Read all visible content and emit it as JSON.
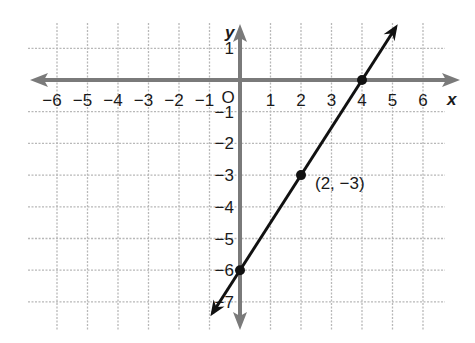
{
  "chart_data": {
    "type": "line",
    "title": "",
    "xlabel": "x",
    "ylabel": "y",
    "origin_label": "O",
    "xlim": [
      -6.5,
      6.5
    ],
    "ylim": [
      -7.5,
      1.9
    ],
    "grid": true,
    "x_ticks": [
      -6,
      -5,
      -4,
      -3,
      -2,
      -1,
      1,
      2,
      3,
      4,
      5,
      6
    ],
    "x_tick_labels": [
      "−6",
      "−5",
      "−4",
      "−3",
      "−2",
      "−1",
      "1",
      "2",
      "3",
      "4",
      "5",
      "6"
    ],
    "y_ticks": [
      1,
      -1,
      -2,
      -3,
      -4,
      -5,
      -6,
      -7
    ],
    "y_tick_labels": [
      "1",
      "−1",
      "−2",
      "−3",
      "−4",
      "−5",
      "−6",
      "−7"
    ],
    "series": [
      {
        "name": "line",
        "equation": "y = 1.5x - 6",
        "x": [
          -0.9,
          5.1
        ],
        "y": [
          -7.35,
          1.65
        ],
        "color": "#111111"
      }
    ],
    "points": [
      {
        "x": 0,
        "y": -6
      },
      {
        "x": 2,
        "y": -3
      },
      {
        "x": 4,
        "y": 0
      }
    ],
    "annotations": [
      {
        "text": "(2, −3)",
        "x": 2,
        "y": -3
      }
    ],
    "colors": {
      "axis": "#7a7a7a",
      "grid": "#b8b8b8",
      "line": "#111111"
    }
  }
}
